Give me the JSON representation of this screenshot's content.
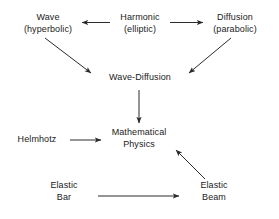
{
  "diagram": {
    "type": "flowchart",
    "background_color": "#ffffff",
    "text_color": "#1a1a1a",
    "arrow_color": "#2b2b2b",
    "nodes": [
      {
        "id": "wave",
        "line1": "Wave",
        "line2": "(hyperbolic)"
      },
      {
        "id": "harmonic",
        "line1": "Harmonic",
        "line2": "(elliptic)"
      },
      {
        "id": "diffusion",
        "line1": "Diffusion",
        "line2": "(parabolic)"
      },
      {
        "id": "wave_diffusion",
        "line1": "Wave-Diffusion",
        "line2": ""
      },
      {
        "id": "helmhotz",
        "line1": "Helmhotz",
        "line2": ""
      },
      {
        "id": "math_physics",
        "line1": "Mathematical",
        "line2": "Physics"
      },
      {
        "id": "elastic_bar",
        "line1": "Elastic",
        "line2": "Bar"
      },
      {
        "id": "elastic_beam",
        "line1": "Elastic",
        "line2": "Beam"
      }
    ],
    "edges": [
      {
        "id": "harmonic-to-wave",
        "from": "harmonic",
        "to": "wave",
        "direction": "left"
      },
      {
        "id": "harmonic-to-diffusion",
        "from": "harmonic",
        "to": "diffusion",
        "direction": "right"
      },
      {
        "id": "wave-to-wave-diffusion",
        "from": "wave",
        "to": "wave_diffusion",
        "direction": "down-right"
      },
      {
        "id": "diffusion-to-wave-diffusion",
        "from": "diffusion",
        "to": "wave_diffusion",
        "direction": "down-left"
      },
      {
        "id": "wave-diffusion-to-math",
        "from": "wave_diffusion",
        "to": "math_physics",
        "direction": "down"
      },
      {
        "id": "helmhotz-to-math",
        "from": "helmhotz",
        "to": "math_physics",
        "direction": "right"
      },
      {
        "id": "elastic-bar-to-elastic-beam",
        "from": "elastic_bar",
        "to": "elastic_beam",
        "direction": "right"
      },
      {
        "id": "elastic-beam-to-math",
        "from": "elastic_beam",
        "to": "math_physics",
        "direction": "up-left"
      }
    ]
  }
}
